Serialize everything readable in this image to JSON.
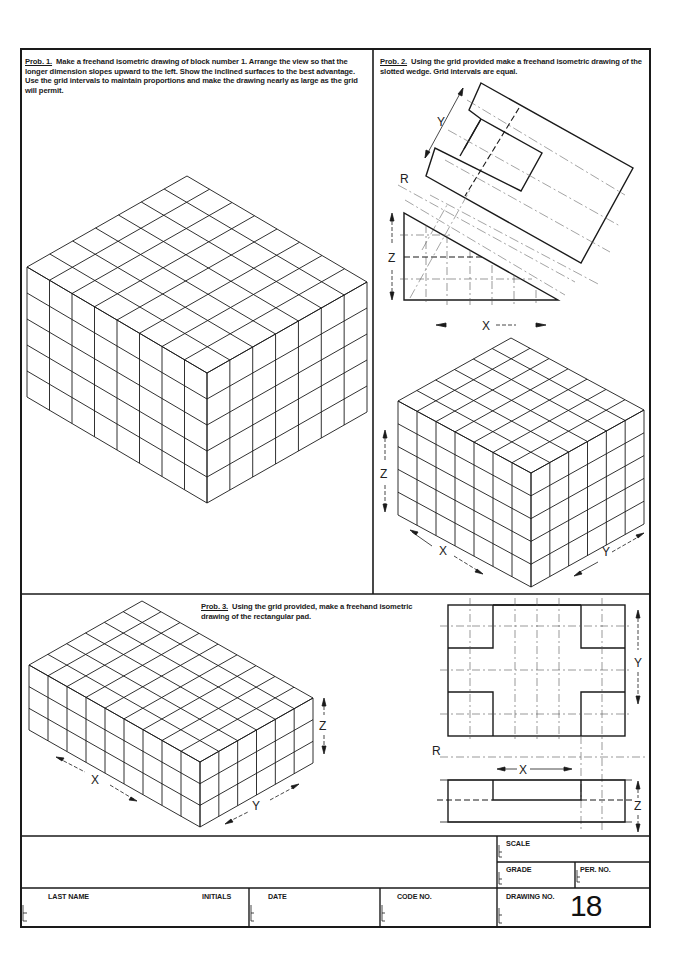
{
  "problems": [
    {
      "label": "Prob. 1.",
      "text": "Make a freehand isometric drawing of block number 1.  Arrange the view so that the longer dimension slopes upward to the left.  Show the inclined surfaces to the best advantage.  Use the grid intervals to maintain proportions and make the drawing nearly as large as the grid will permit."
    },
    {
      "label": "Prob. 2.",
      "text": "Using the grid provided make a freehand isometric drawing of the slotted wedge.  Grid intervals are equal."
    },
    {
      "label": "Prob. 3.",
      "text": "Using the grid provided, make a freehand isometric drawing of the rectangular pad."
    }
  ],
  "iso_grids": [
    {
      "name": "prob1-iso-grid",
      "front_x": 207,
      "front_top": 373,
      "front_bottom": 503,
      "left_x": 27,
      "left_dy": -106,
      "right_x": 367,
      "right_dy": -91,
      "cols_left": 8,
      "cols_right": 7,
      "rows": 5
    },
    {
      "name": "prob2-iso-grid",
      "front_x": 531,
      "front_top": 473,
      "front_bottom": 587,
      "left_x": 398,
      "left_dy": -72,
      "right_x": 644,
      "right_dy": -63,
      "cols_left": 7,
      "cols_right": 6,
      "rows": 5
    },
    {
      "name": "prob3-iso-grid",
      "front_x": 200,
      "front_top": 762,
      "front_bottom": 827,
      "left_x": 29,
      "left_dy": -97,
      "right_x": 313,
      "right_dy": -64,
      "cols_left": 9,
      "cols_right": 6,
      "rows": 3
    }
  ],
  "axis_labels": {
    "p2_top_Y": "Y",
    "p2_R": "R",
    "p2_Z": "Z",
    "p2_X": "X",
    "p2_iso_Z": "Z",
    "p2_iso_X": "X",
    "p2_iso_Y": "Y",
    "p3_iso_Z": "Z",
    "p3_iso_X": "X",
    "p3_iso_Y": "Y",
    "p3_ortho_Y": "Y",
    "p3_ortho_R": "R",
    "p3_ortho_X": "X",
    "p3_ortho_Z": "Z"
  },
  "title_block": {
    "scale_label": "SCALE",
    "grade_label": "GRADE",
    "per_no_label": "PER.  NO.",
    "last_name_label": "LAST  NAME",
    "initials_label": "INITIALS",
    "date_label": "DATE",
    "code_no_label": "CODE  NO.",
    "drawing_no_label": "DRAWING  NO.",
    "drawing_no": "18",
    "scale_value": "",
    "grade_value": "",
    "per_no_value": "",
    "last_name_value": "",
    "initials_value": "",
    "date_value": "",
    "code_no_value": ""
  },
  "colors": {
    "ink": "#1a1a1a",
    "paper": "#ffffff",
    "construction": "#666666"
  }
}
